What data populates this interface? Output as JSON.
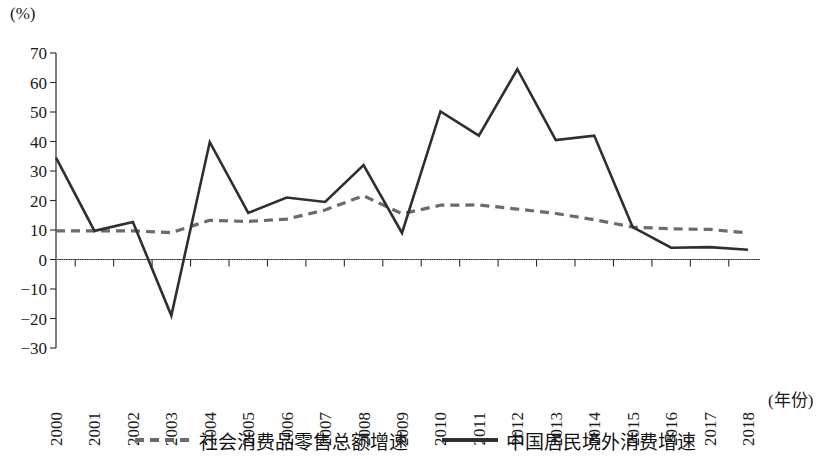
{
  "chart_data": {
    "type": "line",
    "title": "",
    "xlabel": "(年份)",
    "ylabel": "(%)",
    "ylim": [
      -30,
      70
    ],
    "y_ticks": [
      70,
      60,
      50,
      40,
      30,
      20,
      10,
      0,
      -10,
      -20,
      -30
    ],
    "y_tick_labels": [
      "70",
      "60",
      "50",
      "40",
      "30",
      "20",
      "10",
      "0",
      "−10",
      "−20",
      "−30"
    ],
    "grid": false,
    "zero_line": true,
    "legend_position": "bottom",
    "categories": [
      "2000",
      "2001",
      "2002",
      "2003",
      "2004",
      "2005",
      "2006",
      "2007",
      "2008",
      "2009",
      "2010",
      "2011",
      "2012",
      "2013",
      "2014",
      "2015",
      "2016",
      "2017",
      "2018"
    ],
    "series": [
      {
        "name": "社会消费品零售总额增速",
        "style": "dashed",
        "color": "#6b6b6b",
        "values": [
          9.7,
          9.7,
          9.7,
          9.1,
          13.3,
          12.9,
          13.7,
          16.8,
          21.6,
          15.5,
          18.4,
          18.5,
          17.1,
          15.6,
          13.5,
          11.0,
          10.4,
          10.2,
          9.0
        ]
      },
      {
        "name": "中国居民境外消费增速",
        "style": "solid",
        "color": "#2f2f2f",
        "values": [
          34.5,
          9.7,
          12.7,
          -19.0,
          39.8,
          15.8,
          21.0,
          19.5,
          32.0,
          9.0,
          50.2,
          42.0,
          64.5,
          40.5,
          42.0,
          11.0,
          4.0,
          4.2,
          3.3
        ]
      }
    ]
  },
  "axes": {
    "y_unit_label": "(%)",
    "x_caption": "(年份)"
  },
  "legend": {
    "items": [
      {
        "label": "社会消费品零售总额增速",
        "style": "dashed"
      },
      {
        "label": "中国居民境外消费增速",
        "style": "solid"
      }
    ]
  }
}
